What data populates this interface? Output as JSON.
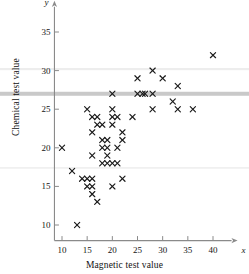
{
  "chart_data": {
    "type": "scatter",
    "title": "",
    "xlabel": "Magnetic test value",
    "ylabel": "Chemical test value",
    "x_axis_symbol": "x",
    "y_axis_symbol": "y",
    "xlim": [
      8.5,
      42.5
    ],
    "ylim": [
      8.5,
      37.5
    ],
    "xticks": [
      10,
      15,
      20,
      25,
      30,
      35,
      40
    ],
    "yticks": [
      10,
      15,
      20,
      25,
      30,
      35
    ],
    "xtick_labels": [
      "10",
      "15",
      "20",
      "25",
      "30",
      "35",
      "40"
    ],
    "ytick_labels": [
      "10",
      "15",
      "20",
      "25",
      "30",
      "35"
    ],
    "grid": false,
    "legend": null,
    "marker": "x",
    "marker_color": "#1a1a1a",
    "axis_color": "#8a8a8a",
    "points": [
      [
        10,
        20
      ],
      [
        12,
        17
      ],
      [
        13,
        10
      ],
      [
        14,
        16
      ],
      [
        15,
        16
      ],
      [
        15,
        15
      ],
      [
        15,
        25
      ],
      [
        16,
        16
      ],
      [
        16,
        15
      ],
      [
        16,
        19
      ],
      [
        16,
        22
      ],
      [
        16,
        24
      ],
      [
        16,
        14
      ],
      [
        17,
        24
      ],
      [
        17,
        23
      ],
      [
        17,
        13
      ],
      [
        18,
        21
      ],
      [
        18,
        20
      ],
      [
        18,
        18
      ],
      [
        18,
        23
      ],
      [
        19,
        21
      ],
      [
        19,
        20
      ],
      [
        19,
        19
      ],
      [
        19,
        18
      ],
      [
        20,
        18
      ],
      [
        20,
        15
      ],
      [
        20,
        27
      ],
      [
        20,
        25
      ],
      [
        20,
        24
      ],
      [
        20,
        23
      ],
      [
        21,
        24
      ],
      [
        21,
        20
      ],
      [
        21,
        18
      ],
      [
        22,
        22
      ],
      [
        22,
        21
      ],
      [
        22,
        16
      ],
      [
        24,
        24
      ],
      [
        25,
        29
      ],
      [
        25,
        27
      ],
      [
        26,
        27
      ],
      [
        26.5,
        27
      ],
      [
        28,
        30
      ],
      [
        28,
        27
      ],
      [
        28,
        25
      ],
      [
        30,
        29
      ],
      [
        32,
        26
      ],
      [
        33,
        28
      ],
      [
        33,
        25
      ],
      [
        36,
        25
      ],
      [
        40,
        32
      ]
    ],
    "reference_bands": [
      {
        "name": "upper-faint-band",
        "y_value": 30.2,
        "color": "#ededed",
        "thickness": 2.2
      },
      {
        "name": "main-gray-band",
        "y_value": 27.0,
        "color": "#c9c9c9",
        "thickness": 4.0
      },
      {
        "name": "lower-faint-band",
        "y_value": 17.4,
        "color": "#f0f0f0",
        "thickness": 1.8
      }
    ]
  }
}
